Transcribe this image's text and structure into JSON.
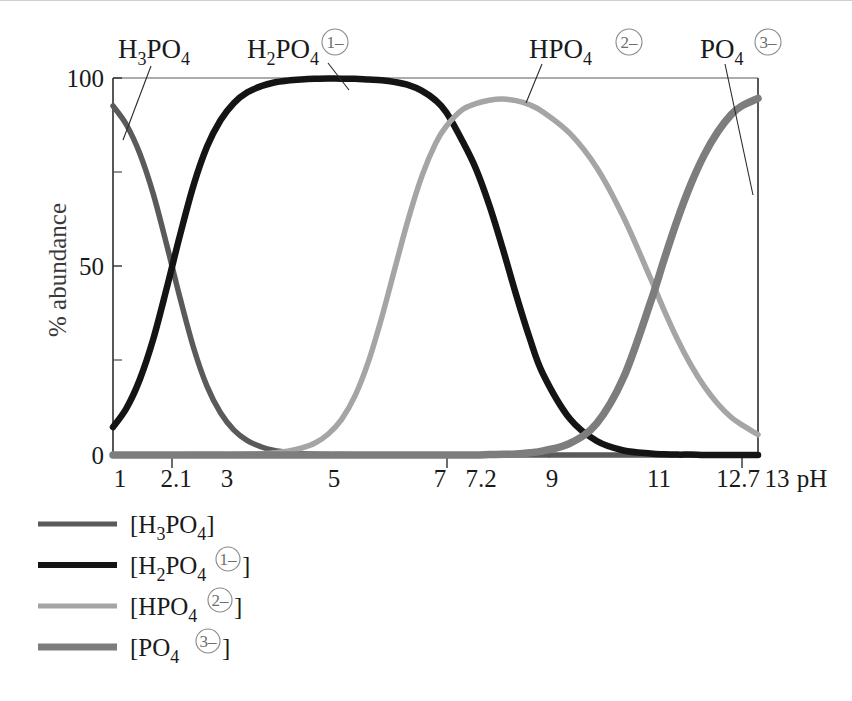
{
  "figure": {
    "kind": "speciation-diagram",
    "background": "#ffffff"
  },
  "axes": {
    "y_title": "% abundance",
    "y_ticks": [
      "100",
      "50",
      "0"
    ],
    "y_tick_values": [
      100,
      50,
      0
    ],
    "y_minor_values": [
      75,
      25
    ],
    "x_title": "pH",
    "x_ticks": [
      "1",
      "2.1",
      "3",
      "5",
      "7",
      "7.2",
      "9",
      "11",
      "12.7",
      "13"
    ],
    "x_tick_values": [
      1,
      2.1,
      3,
      5,
      7,
      7.2,
      9,
      11,
      12.7,
      13
    ],
    "x_major_tick_values": [
      2.1,
      7.2,
      12.7
    ],
    "xlim": [
      1,
      13
    ],
    "ylim": [
      0,
      100
    ],
    "grid": "off"
  },
  "callouts": [
    {
      "name": "h3po4",
      "formula": "H",
      "sub1": "3",
      "mid": "PO",
      "sub2": "4",
      "charge": "",
      "color": "#5a5a5a"
    },
    {
      "name": "h2po4",
      "formula": "H",
      "sub1": "2",
      "mid": "PO",
      "sub2": "4",
      "charge": "1–",
      "color": "#1a1a1a"
    },
    {
      "name": "hpo4",
      "formula": "H",
      "sub1": "",
      "mid": "PO",
      "sub2": "4",
      "charge": "2–",
      "color": "#9b9b9b"
    },
    {
      "name": "po4",
      "formula": "",
      "sub1": "",
      "mid": "PO",
      "sub2": "4",
      "charge": "3–",
      "color": "#7d7d7d"
    }
  ],
  "legend": {
    "position": "below-axes",
    "entries": [
      {
        "name": "h3po4",
        "open": "[",
        "main": "H",
        "sub1": "3",
        "mid": "PO",
        "sub2": "4",
        "charge": "",
        "close": "]",
        "color": "#5a5a5a",
        "width": 5
      },
      {
        "name": "h2po4",
        "open": "[",
        "main": "H",
        "sub1": "2",
        "mid": "PO",
        "sub2": "4",
        "charge": "1–",
        "close": "]",
        "color": "#141414",
        "width": 6
      },
      {
        "name": "hpo4",
        "open": "[",
        "main": "H",
        "sub1": "",
        "mid": "PO",
        "sub2": "4",
        "charge": "2–",
        "close": "]",
        "color": "#a5a5a5",
        "width": 5
      },
      {
        "name": "po4",
        "open": "[",
        "main": "",
        "sub1": "",
        "mid": "PO",
        "sub2": "4",
        "charge": "3–",
        "close": "]",
        "color": "#7d7d7d",
        "width": 7
      }
    ]
  },
  "chart_data": {
    "type": "line",
    "title": "",
    "xlabel": "pH",
    "ylabel": "% abundance",
    "xlim": [
      1,
      13
    ],
    "ylim": [
      0,
      100
    ],
    "grid": false,
    "legend_position": "below",
    "pka": [
      2.1,
      7.2,
      12.7
    ],
    "x": [
      1,
      1.25,
      1.5,
      1.75,
      2,
      2.1,
      2.25,
      2.5,
      2.75,
      3,
      3.25,
      3.5,
      3.75,
      4,
      4.25,
      4.5,
      4.75,
      5,
      5.25,
      5.5,
      5.75,
      6,
      6.25,
      6.5,
      6.75,
      7,
      7.2,
      7.5,
      7.75,
      8,
      8.25,
      8.5,
      8.75,
      9,
      9.5,
      10,
      10.5,
      11,
      11.25,
      11.5,
      11.75,
      12,
      12.25,
      12.5,
      12.7,
      13
    ],
    "series": [
      {
        "name": "[H3PO4]",
        "color": "#5a5a5a",
        "values": [
          92.6,
          87.6,
          79.9,
          69.2,
          55.7,
          50.0,
          41.5,
          28.4,
          18.2,
          11.2,
          6.6,
          3.8,
          2.2,
          1.2,
          0.7,
          0.4,
          0.2,
          0.1,
          0.1,
          0.0,
          0.0,
          0.0,
          0.0,
          0.0,
          0.0,
          0.0,
          0.0,
          0.0,
          0.0,
          0.0,
          0.0,
          0.0,
          0.0,
          0.0,
          0.0,
          0.0,
          0.0,
          0.0,
          0.0,
          0.0,
          0.0,
          0.0,
          0.0,
          0.0,
          0.0,
          0.0
        ]
      },
      {
        "name": "[H2PO4(1-)]",
        "color": "#141414",
        "values": [
          7.4,
          12.4,
          20.1,
          30.8,
          44.3,
          50.0,
          58.5,
          71.6,
          81.8,
          88.8,
          93.4,
          96.2,
          97.8,
          98.8,
          99.3,
          99.6,
          99.8,
          99.9,
          99.8,
          99.8,
          99.6,
          99.4,
          98.9,
          98.1,
          96.6,
          94.1,
          90.9,
          83.3,
          76.0,
          66.3,
          54.8,
          42.5,
          31.1,
          21.5,
          9.6,
          3.7,
          1.2,
          0.4,
          0.2,
          0.1,
          0.1,
          0.0,
          0.0,
          0.0,
          0.0,
          0.0
        ]
      },
      {
        "name": "[HPO4(2-)]",
        "color": "#a5a5a5",
        "values": [
          0.0,
          0.0,
          0.0,
          0.0,
          0.0,
          0.0,
          0.0,
          0.1,
          0.1,
          0.1,
          0.1,
          0.2,
          0.3,
          0.6,
          1.0,
          1.8,
          3.1,
          5.5,
          9.4,
          15.6,
          24.7,
          36.5,
          49.8,
          62.9,
          74.1,
          82.6,
          87.2,
          91.6,
          93.2,
          94.1,
          94.4,
          94.0,
          92.9,
          91.0,
          85.3,
          76.2,
          63.0,
          46.9,
          38.5,
          30.7,
          23.9,
          18.2,
          13.6,
          10.0,
          8.0,
          5.4
        ]
      },
      {
        "name": "[PO4(3-)]",
        "color": "#7d7d7d",
        "values": [
          0.0,
          0.0,
          0.0,
          0.0,
          0.0,
          0.0,
          0.0,
          0.0,
          0.0,
          0.0,
          0.0,
          0.0,
          0.0,
          0.0,
          0.0,
          0.0,
          0.0,
          0.0,
          0.0,
          0.0,
          0.0,
          0.0,
          0.0,
          0.0,
          0.0,
          0.0,
          0.0,
          0.0,
          0.0,
          0.1,
          0.2,
          0.3,
          0.6,
          1.1,
          3.1,
          8.4,
          20.6,
          40.5,
          51.7,
          62.4,
          71.8,
          79.6,
          85.7,
          90.3,
          92.6,
          94.6
        ]
      }
    ]
  }
}
